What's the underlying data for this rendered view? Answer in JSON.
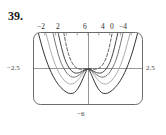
{
  "figure": {
    "exercise_number": "39.",
    "top_tick_labels": [
      "−2",
      "2",
      "6",
      "4",
      "0",
      "−4"
    ],
    "left_label": "−2.5",
    "right_label": "2.5",
    "bottom_label": "−6",
    "frame_color": "#6b6b6b",
    "axis_color": "#8a8a8a",
    "curve_colors": {
      "dark": "#2a2a2a",
      "mid": "#6d6d6d",
      "light": "#a8a8a8",
      "dashed": "#3a3a3a"
    }
  },
  "chart_data": {
    "type": "line",
    "title": "",
    "xlabel": "",
    "ylabel": "",
    "xlim": [
      -2.5,
      2.5
    ],
    "ylim": [
      -6,
      6
    ],
    "grid": false,
    "axes": {
      "x_axis_at_y": 0,
      "y_axis_at_x": 0,
      "top_tick_labels": [
        "-2",
        "2",
        "6",
        "4",
        "0",
        "-4"
      ],
      "left_tick_label": "-2.5",
      "right_tick_label": "2.5",
      "bottom_tick_label": "-6"
    },
    "annotations": [
      "39."
    ],
    "series": [
      {
        "name": "curve-1-dark-widest",
        "style": "solid",
        "color": "#2a2a2a",
        "points": [
          [
            -2.3,
            6.0
          ],
          [
            -2.05,
            2.6
          ],
          [
            -1.85,
            0.55
          ],
          [
            -1.7,
            -0.7
          ],
          [
            -1.5,
            -2.1
          ],
          [
            -1.25,
            -3.3
          ],
          [
            -1.0,
            -4.05
          ],
          [
            -0.8,
            -4.3
          ],
          [
            -0.62,
            -4.1
          ],
          [
            -0.45,
            -3.35
          ],
          [
            -0.3,
            -2.25
          ],
          [
            -0.18,
            -1.2
          ],
          [
            -0.08,
            -0.42
          ],
          [
            0.0,
            0.0
          ],
          [
            0.08,
            -0.42
          ],
          [
            0.18,
            -1.2
          ],
          [
            0.3,
            -2.25
          ],
          [
            0.45,
            -3.35
          ],
          [
            0.62,
            -4.1
          ],
          [
            0.8,
            -4.3
          ],
          [
            1.0,
            -4.05
          ],
          [
            1.25,
            -3.3
          ],
          [
            1.5,
            -2.1
          ],
          [
            1.7,
            -0.7
          ],
          [
            1.85,
            0.55
          ],
          [
            2.05,
            2.6
          ],
          [
            2.3,
            6.0
          ]
        ]
      },
      {
        "name": "curve-2-light",
        "style": "solid",
        "color": "#a8a8a8",
        "points": [
          [
            -1.95,
            6.0
          ],
          [
            -1.75,
            3.2
          ],
          [
            -1.58,
            1.2
          ],
          [
            -1.42,
            -0.2
          ],
          [
            -1.22,
            -1.55
          ],
          [
            -1.0,
            -2.4
          ],
          [
            -0.8,
            -2.7
          ],
          [
            -0.62,
            -2.5
          ],
          [
            -0.45,
            -1.9
          ],
          [
            -0.3,
            -1.15
          ],
          [
            -0.16,
            -0.45
          ],
          [
            0.0,
            0.0
          ],
          [
            0.16,
            -0.45
          ],
          [
            0.3,
            -1.15
          ],
          [
            0.45,
            -1.9
          ],
          [
            0.62,
            -2.5
          ],
          [
            0.8,
            -2.7
          ],
          [
            1.0,
            -2.4
          ],
          [
            1.22,
            -1.55
          ],
          [
            1.42,
            -0.2
          ],
          [
            1.58,
            1.2
          ],
          [
            1.75,
            3.2
          ],
          [
            1.95,
            6.0
          ]
        ]
      },
      {
        "name": "curve-3-mid",
        "style": "solid",
        "color": "#6d6d6d",
        "points": [
          [
            -1.62,
            6.0
          ],
          [
            -1.45,
            3.3
          ],
          [
            -1.3,
            1.4
          ],
          [
            -1.15,
            0.2
          ],
          [
            -0.98,
            -0.85
          ],
          [
            -0.8,
            -1.4
          ],
          [
            -0.62,
            -1.5
          ],
          [
            -0.46,
            -1.25
          ],
          [
            -0.3,
            -0.8
          ],
          [
            -0.15,
            -0.32
          ],
          [
            0.0,
            0.0
          ],
          [
            0.15,
            -0.32
          ],
          [
            0.3,
            -0.8
          ],
          [
            0.46,
            -1.25
          ],
          [
            0.62,
            -1.5
          ],
          [
            0.8,
            -1.4
          ],
          [
            0.98,
            -0.85
          ],
          [
            1.15,
            0.2
          ],
          [
            1.3,
            1.4
          ],
          [
            1.45,
            3.3
          ],
          [
            1.62,
            6.0
          ]
        ]
      },
      {
        "name": "curve-4-dark-narrow",
        "style": "solid",
        "color": "#3a3a3a",
        "points": [
          [
            -1.38,
            6.0
          ],
          [
            -1.22,
            3.4
          ],
          [
            -1.08,
            1.6
          ],
          [
            -0.94,
            0.45
          ],
          [
            -0.78,
            -0.38
          ],
          [
            -0.62,
            -0.78
          ],
          [
            -0.46,
            -0.8
          ],
          [
            -0.32,
            -0.58
          ],
          [
            -0.18,
            -0.28
          ],
          [
            0.0,
            0.0
          ],
          [
            0.18,
            -0.28
          ],
          [
            0.32,
            -0.58
          ],
          [
            0.46,
            -0.8
          ],
          [
            0.62,
            -0.78
          ],
          [
            0.78,
            -0.38
          ],
          [
            0.94,
            0.45
          ],
          [
            1.08,
            1.6
          ],
          [
            1.22,
            3.4
          ],
          [
            1.38,
            6.0
          ]
        ]
      },
      {
        "name": "curve-5-dashed-narrowest",
        "style": "dashed",
        "color": "#3a3a3a",
        "points": [
          [
            -1.12,
            6.0
          ],
          [
            -0.98,
            3.4
          ],
          [
            -0.84,
            1.7
          ],
          [
            -0.7,
            0.7
          ],
          [
            -0.56,
            0.14
          ],
          [
            -0.42,
            -0.1
          ],
          [
            -0.3,
            -0.14
          ],
          [
            -0.18,
            -0.08
          ],
          [
            0.0,
            0.0
          ],
          [
            0.18,
            -0.08
          ],
          [
            0.3,
            -0.14
          ],
          [
            0.42,
            -0.1
          ],
          [
            0.56,
            0.14
          ],
          [
            0.7,
            0.7
          ],
          [
            0.84,
            1.7
          ],
          [
            0.98,
            3.4
          ],
          [
            1.12,
            6.0
          ]
        ]
      }
    ]
  }
}
